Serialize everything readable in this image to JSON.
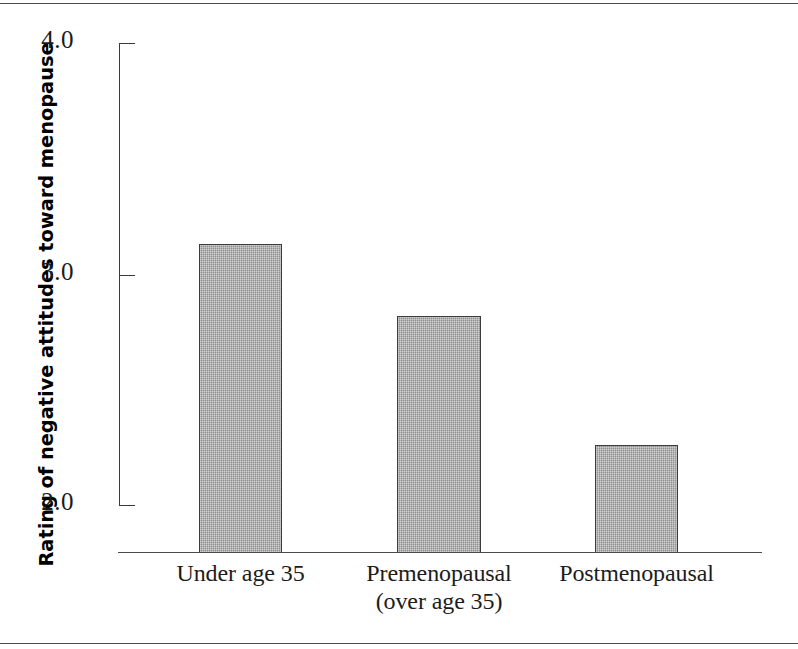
{
  "figure": {
    "has_top_rule": true,
    "has_bottom_rule": true
  },
  "chart_data": {
    "type": "bar",
    "title": "",
    "xlabel": "",
    "ylabel": "Rating of negative attitudes toward menopause",
    "categories": [
      "Under age 35",
      "Premenopausal (over age 35)",
      "Postmenopausal"
    ],
    "category_lines": [
      [
        "Under age 35"
      ],
      [
        "Premenopausal",
        "(over age 35)"
      ],
      [
        "Postmenopausal"
      ]
    ],
    "values": [
      3.13,
      2.82,
      2.26
    ],
    "ylim": [
      1.79,
      4.0
    ],
    "yticks": [
      2.0,
      3.0,
      4.0
    ],
    "ytick_labels": [
      "2.0",
      "3.0",
      "4.0"
    ],
    "grid": false,
    "legend": null,
    "bar_fill_color": "#9d9d9d",
    "bar_edge_color": "#3c3c3c",
    "axis_color": "#3a3a3a",
    "axis_break_below": 2.0
  }
}
